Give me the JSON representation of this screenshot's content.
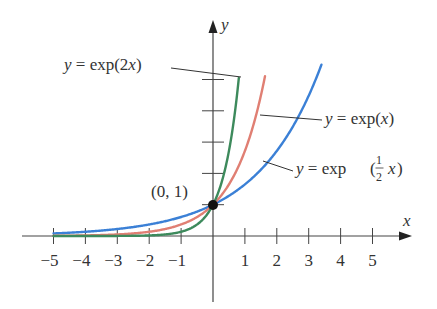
{
  "chart_data": {
    "type": "line",
    "title": "",
    "xlabel": "x",
    "ylabel": "y",
    "xlim": [
      -5.6,
      6.2
    ],
    "ylim": [
      -3.0,
      5.7
    ],
    "grid": false,
    "legend": "inline-annotations",
    "x_ticks": [
      -5,
      -4,
      -3,
      -2,
      -1,
      1,
      2,
      3,
      4,
      5
    ],
    "x_tick_labels": [
      "−5",
      "−4",
      "−3",
      "−2",
      "−1",
      "1",
      "2",
      "3",
      "4",
      "5"
    ],
    "y_ticks": [
      1,
      2,
      3,
      4,
      5
    ],
    "series": [
      {
        "name": "y = exp(2x)",
        "function": "exp(2x)",
        "k": 2,
        "color": "#3d8a5c",
        "x_range": [
          -5,
          0.81
        ]
      },
      {
        "name": "y = exp(x)",
        "function": "exp(x)",
        "k": 1,
        "color": "#e07f73",
        "x_range": [
          -5,
          1.63
        ]
      },
      {
        "name": "y = exp(1/2 x)",
        "function": "exp(x/2)",
        "k": 0.5,
        "color": "#3b80d6",
        "x_range": [
          -5,
          3.4
        ]
      }
    ],
    "annotations": [
      {
        "text": "(0, 1)",
        "point": [
          0,
          1
        ],
        "marker": "filled-circle"
      },
      {
        "text": "y = exp(2x)",
        "series": 0
      },
      {
        "text": "y = exp(x)",
        "series": 1
      },
      {
        "text": "y = exp(1/2 x)",
        "series": 2
      }
    ]
  },
  "labels": {
    "axis_x": "x",
    "axis_y": "y",
    "point": "(0, 1)",
    "exp2x": {
      "y": "y",
      "eq": " = exp(2",
      "x": "x",
      "close": ")"
    },
    "expx": {
      "y": "y",
      "eq": " = exp(",
      "x": "x",
      "close": ")"
    },
    "exphalf": {
      "y": "y",
      "eq": " = exp",
      "num": "1",
      "den": "2",
      "x": "x"
    }
  }
}
